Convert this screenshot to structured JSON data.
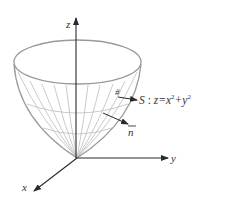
{
  "diagram": {
    "axes": {
      "x_label": "x",
      "y_label": "y",
      "z_label": "z"
    },
    "surface": {
      "name": "S",
      "separator": " : ",
      "equation_lhs": "z=x",
      "exp1": "2",
      "plus": "+y",
      "exp2": "2",
      "full_equation": "S : z=x²+y²"
    },
    "mark": "#",
    "normal_label": "n",
    "colors": {
      "axis": "#2a2a2a",
      "surface_outline": "#9a9a9a",
      "mesh": "#b5b5b5",
      "text": "#333333"
    }
  }
}
